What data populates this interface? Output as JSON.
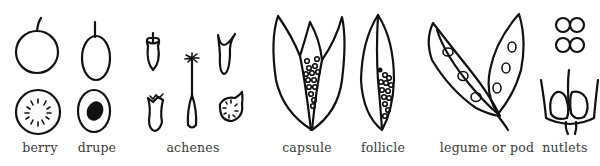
{
  "diagram": {
    "labels": [
      {
        "id": "berry",
        "text": "berry",
        "x": 40
      },
      {
        "id": "drupe",
        "text": "drupe",
        "x": 97
      },
      {
        "id": "achenes",
        "text": "achenes",
        "x": 193
      },
      {
        "id": "capsule",
        "text": "capsule",
        "x": 307
      },
      {
        "id": "follicle",
        "text": "follicle",
        "x": 383
      },
      {
        "id": "legume",
        "text": "legume or pod",
        "x": 487
      },
      {
        "id": "nutlets",
        "text": "nutlets",
        "x": 565
      }
    ],
    "colors": {
      "ink": "#111111",
      "label": "#3a3a3a",
      "background": "#ffffff"
    }
  }
}
